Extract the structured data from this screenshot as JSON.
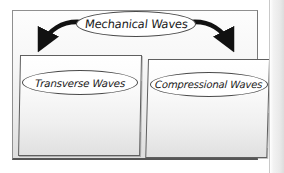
{
  "diagram": {
    "root": {
      "label": "Mechanical Waves"
    },
    "branches": [
      {
        "label": "Transverse Waves"
      },
      {
        "label": "Compressional Waves"
      }
    ],
    "connectors": [
      {
        "name": "arrow-root-to-transverse",
        "direction": "down-left"
      },
      {
        "name": "arrow-root-to-compressional",
        "direction": "down-right"
      }
    ],
    "colors": {
      "ink": "#1a1a1a",
      "arrow": "#111111",
      "outer_border": "#8f8f8f",
      "inner_border": "#5f5f5f",
      "page_background": "#ffffff"
    }
  }
}
